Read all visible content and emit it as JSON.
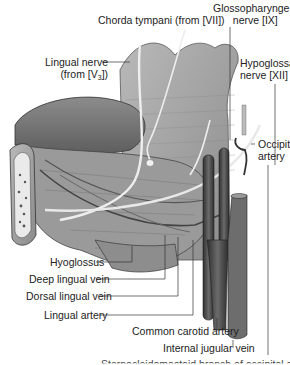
{
  "figure": {
    "colors": {
      "tongue": "#7a7a7a",
      "muscle": "#a3a3a3",
      "nerve": "#e6e6e6",
      "vessel_dark": "#4a4a4a",
      "bone": "#e8e8e8",
      "leader_line": "#333333"
    }
  },
  "labels": {
    "chorda_tympani": "Chorda tympani (from [VII])",
    "glossopharyngeal_line1": "Glossopharyngeal",
    "glossopharyngeal_line2": "nerve [IX]",
    "lingual_nerve_line1": "Lingual nerve",
    "lingual_nerve_line2_prefix": "(from [V",
    "lingual_nerve_line2_sub": "3",
    "lingual_nerve_line2_suffix": "])",
    "hypoglossal_line1": "Hypoglossal",
    "hypoglossal_line2": "nerve [XII]",
    "occipital_line1": "Occipital",
    "occipital_line2": "artery",
    "hyoglossus": "Hyoglossus",
    "deep_lingual_vein": "Deep lingual vein",
    "dorsal_lingual_vein": "Dorsal lingual vein",
    "lingual_artery": "Lingual artery",
    "common_carotid": "Common carotid artery",
    "internal_jugular": "Internal jugular vein",
    "bottom_cut": "Sternocleidomastoid branch of occipital artery"
  }
}
